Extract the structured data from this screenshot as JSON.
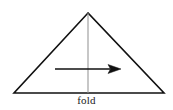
{
  "figure": {
    "background_color": "#ffffff",
    "label": "fold",
    "label_color": "#1a1a1a",
    "stroke_color": "#111111",
    "fold_line_color": "#8f8f8f",
    "arrow_color": "#111111",
    "triangle": {
      "apex": {
        "x": 88,
        "y": 13
      },
      "bottom_left": {
        "x": 14,
        "y": 93
      },
      "bottom_right": {
        "x": 164,
        "y": 93
      },
      "stroke_width": 1.6
    },
    "fold_line": {
      "x": 88,
      "y_top": 13,
      "y_bottom": 93,
      "stroke_width": 1
    },
    "arrow": {
      "x_start": 55,
      "x_end": 121,
      "y": 69,
      "stroke_width": 1.4,
      "head_length": 13,
      "head_half_width": 4.5,
      "direction": "right"
    }
  }
}
